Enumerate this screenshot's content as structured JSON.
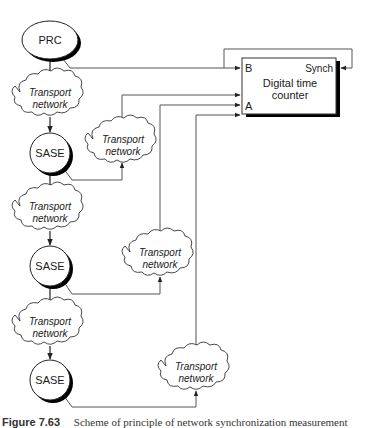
{
  "diagram": {
    "type": "network-synchronization-measurement-scheme",
    "colors": {
      "line": "#555555",
      "stroke": "#222222",
      "shadow": "#000000",
      "background": "#ffffff"
    },
    "prc": {
      "label": "PRC"
    },
    "sase_nodes": [
      {
        "label": "SASE"
      },
      {
        "label": "SASE"
      },
      {
        "label": "SASE"
      }
    ],
    "chain_clouds": [
      {
        "line1": "Transport",
        "line2": "network"
      },
      {
        "line1": "Transport",
        "line2": "network"
      },
      {
        "line1": "Transport",
        "line2": "network"
      }
    ],
    "return_clouds": [
      {
        "line1": "Transport",
        "line2": "network"
      },
      {
        "line1": "Transport",
        "line2": "network"
      },
      {
        "line1": "Transport",
        "line2": "network"
      }
    ],
    "counter": {
      "title_line1": "Digital time",
      "title_line2": "counter",
      "port_b": "B",
      "port_a": "A",
      "port_synch": "Synch"
    },
    "edges": [
      {
        "from": "PRC",
        "to": "chain_cloud_1"
      },
      {
        "from": "chain_cloud_1",
        "to": "SASE_1"
      },
      {
        "from": "SASE_1",
        "to": "chain_cloud_2"
      },
      {
        "from": "chain_cloud_2",
        "to": "SASE_2"
      },
      {
        "from": "SASE_2",
        "to": "chain_cloud_3"
      },
      {
        "from": "chain_cloud_3",
        "to": "SASE_3"
      },
      {
        "from": "PRC",
        "to": "counter.B"
      },
      {
        "from": "counter.B_line",
        "to": "counter.Synch"
      },
      {
        "from": "SASE_1",
        "to": "return_cloud_1"
      },
      {
        "from": "return_cloud_1",
        "to": "counter.A"
      },
      {
        "from": "SASE_2",
        "to": "return_cloud_2"
      },
      {
        "from": "return_cloud_2",
        "to": "counter.A"
      },
      {
        "from": "SASE_3",
        "to": "return_cloud_3"
      },
      {
        "from": "return_cloud_3",
        "to": "counter.A"
      }
    ]
  },
  "caption": {
    "figure_number": "Figure 7.63",
    "text": "Scheme of principle of network synchronization measurement"
  }
}
